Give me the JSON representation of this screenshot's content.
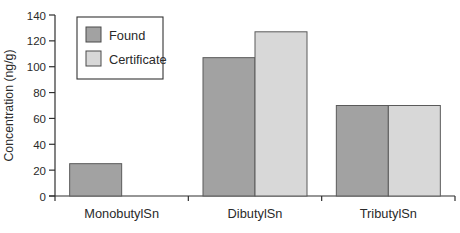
{
  "chart_data": {
    "type": "bar",
    "title": "",
    "xlabel": "",
    "ylabel": "Concentration (ng/g)",
    "ylim": [
      0,
      140
    ],
    "yticks": [
      0,
      20,
      40,
      60,
      80,
      100,
      120,
      140
    ],
    "categories": [
      "MonobutylSn",
      "DibutylSn",
      "TributylSn"
    ],
    "series": [
      {
        "name": "Found",
        "color": "#a2a2a2",
        "values": [
          25,
          107,
          70
        ]
      },
      {
        "name": "Certificate",
        "color": "#d8d8d8",
        "values": [
          0,
          127,
          70
        ]
      }
    ],
    "legend": {
      "position": "top-left-inside",
      "entries": [
        "Found",
        "Certificate"
      ]
    },
    "grid": false
  },
  "colors": {
    "background": "#ffffff",
    "axis": "#2f2f2f",
    "text": "#2a2a2a",
    "bar_border": "#5a5a5a",
    "legend_border": "#333333",
    "found_fill": "#a2a2a2",
    "certificate_fill": "#d8d8d8"
  }
}
